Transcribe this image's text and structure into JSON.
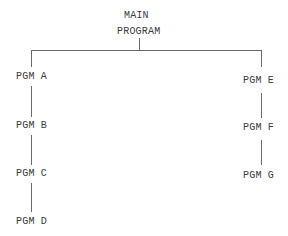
{
  "diagram": {
    "type": "hierarchy-chart",
    "root": {
      "line1": "MAIN",
      "line2": "PROGRAM"
    },
    "left_branch": [
      {
        "label": "PGM A"
      },
      {
        "label": "PGM B"
      },
      {
        "label": "PGM C"
      },
      {
        "label": "PGM D"
      }
    ],
    "right_branch": [
      {
        "label": "PGM E"
      },
      {
        "label": "PGM F"
      },
      {
        "label": "PGM G"
      }
    ],
    "colors": {
      "text": "#3a3a3a",
      "lines": "#6a6a6a",
      "background": "#ffffff"
    }
  }
}
